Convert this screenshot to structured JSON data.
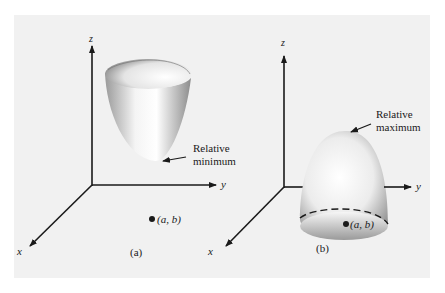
{
  "figure": {
    "panels": [
      {
        "id": "a",
        "caption": "(a)",
        "surface": "paraboloid opening upward",
        "axes": {
          "z": "z",
          "y": "y",
          "x": "x"
        },
        "annotation": {
          "line1": "Relative",
          "line2": "minimum"
        },
        "point_label": "(a, b)"
      },
      {
        "id": "b",
        "caption": "(b)",
        "surface": "paraboloid opening downward",
        "axes": {
          "z": "z",
          "y": "y",
          "x": "x"
        },
        "annotation": {
          "line1": "Relative",
          "line2": "maximum"
        },
        "point_label": "(a, b)"
      }
    ],
    "colors": {
      "background": "#f1f1f1",
      "axis": "#1a1a1a",
      "surface_light": "#ffffff",
      "surface_dark": "#8a8a8a"
    }
  }
}
